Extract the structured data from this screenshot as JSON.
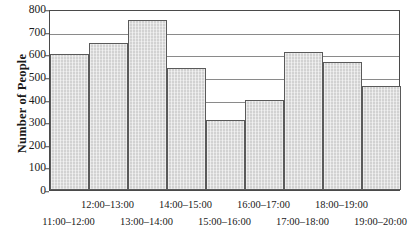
{
  "chart_data": {
    "type": "bar",
    "title": "",
    "xlabel": "",
    "ylabel": "Number of People",
    "categories": [
      "11:00–12:00",
      "12:00–13:00",
      "13:00–14:00",
      "14:00–15:00",
      "15:00–16:00",
      "16:00–17:00",
      "17:00–18:00",
      "18:00–19:00",
      "19:00–20:00"
    ],
    "values": [
      600,
      650,
      750,
      540,
      310,
      400,
      610,
      565,
      460
    ],
    "ylim": [
      0,
      800
    ],
    "yticks": [
      0,
      100,
      200,
      300,
      400,
      500,
      600,
      700,
      800
    ],
    "ytick_labels": [
      "0",
      "100",
      "200",
      "300",
      "400",
      "500",
      "600",
      "700",
      "800"
    ],
    "gridlines": [
      400,
      500,
      600,
      700,
      800
    ],
    "grid": true,
    "legend": null,
    "legend_position": "none",
    "bar_fill_color": "#d2d2d2",
    "bar_edge_color": "#5a5a5a",
    "axis_color": "#4a4a4a",
    "grid_color": "#8a8a8a"
  }
}
